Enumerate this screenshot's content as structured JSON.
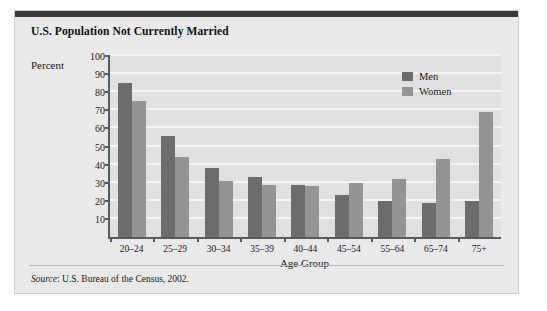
{
  "figure": {
    "title": "U.S. Population Not Currently Married",
    "source_label": "Source",
    "source_text": ": U.S. Bureau of the Census, 2002."
  },
  "legend": {
    "position": "inside-top-right",
    "entries": [
      {
        "label": "Men",
        "color": "#6c6c6c",
        "swatch_name": "legend-swatch-men"
      },
      {
        "label": "Women",
        "color": "#949494",
        "swatch_name": "legend-swatch-women"
      }
    ]
  },
  "chart_data": {
    "type": "bar",
    "title": "U.S. Population Not Currently Married",
    "xlabel": "Age Group",
    "ylabel": "Percent",
    "ylim": [
      0,
      100
    ],
    "yticks": [
      10,
      20,
      30,
      40,
      50,
      60,
      70,
      80,
      90,
      100
    ],
    "grid": true,
    "categories": [
      "20–24",
      "25–29",
      "30–34",
      "35–39",
      "40–44",
      "45–54",
      "55–64",
      "65–74",
      "75+"
    ],
    "series": [
      {
        "name": "Men",
        "color": "#6c6c6c",
        "values": [
          85,
          56,
          38,
          33,
          29,
          23,
          20,
          19,
          20
        ]
      },
      {
        "name": "Women",
        "color": "#949494",
        "values": [
          75,
          44,
          31,
          29,
          28,
          30,
          32,
          43,
          69
        ]
      }
    ]
  }
}
